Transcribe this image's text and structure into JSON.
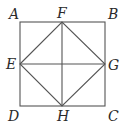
{
  "diagram": {
    "type": "geometry",
    "line_color": "#555555",
    "points": {
      "A": {
        "label": "A",
        "x": 20,
        "y": 22
      },
      "B": {
        "label": "B",
        "x": 105,
        "y": 22
      },
      "C": {
        "label": "C",
        "x": 105,
        "y": 106
      },
      "D": {
        "label": "D",
        "x": 20,
        "y": 106
      },
      "E": {
        "label": "E",
        "x": 20,
        "y": 64
      },
      "F": {
        "label": "F",
        "x": 62,
        "y": 22
      },
      "G": {
        "label": "G",
        "x": 105,
        "y": 64
      },
      "H": {
        "label": "H",
        "x": 62,
        "y": 106
      }
    },
    "segments": [
      [
        "A",
        "B"
      ],
      [
        "B",
        "C"
      ],
      [
        "C",
        "D"
      ],
      [
        "D",
        "A"
      ],
      [
        "E",
        "F"
      ],
      [
        "F",
        "G"
      ],
      [
        "G",
        "H"
      ],
      [
        "H",
        "E"
      ],
      [
        "E",
        "G"
      ],
      [
        "F",
        "H"
      ]
    ]
  }
}
